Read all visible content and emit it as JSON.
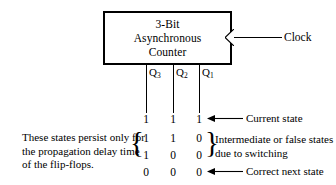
{
  "diagram": {
    "block": {
      "lines": [
        "3-Bit",
        "Asynchronous",
        "Counter"
      ],
      "clock_label": "Clock",
      "clock_icon": "clock-input-triangle"
    },
    "outputs": [
      {
        "name": "Q3",
        "base": "Q",
        "sub": "3"
      },
      {
        "name": "Q2",
        "base": "Q",
        "sub": "2"
      },
      {
        "name": "Q1",
        "base": "Q",
        "sub": "1"
      }
    ],
    "rows": [
      {
        "bits": [
          "1",
          "1",
          "1"
        ],
        "annotation": "Current state",
        "arrow": "left-arrow-icon"
      },
      {
        "bits": [
          "1",
          "1",
          "0"
        ],
        "annotation": "",
        "arrow": ""
      },
      {
        "bits": [
          "1",
          "0",
          "0"
        ],
        "annotation": "",
        "arrow": ""
      },
      {
        "bits": [
          "0",
          "0",
          "0"
        ],
        "annotation": "Correct next state",
        "arrow": "left-arrow-icon"
      }
    ],
    "left_note": {
      "lines": [
        "These states persist only for",
        "the propagation delay time",
        "of the flip-flops."
      ],
      "brace": "{"
    },
    "right_note": {
      "lines": [
        "Intermediate or false states",
        "due to switching"
      ],
      "brace": "}"
    },
    "colors": {
      "ink": "#000000",
      "background": "#ffffff"
    }
  }
}
